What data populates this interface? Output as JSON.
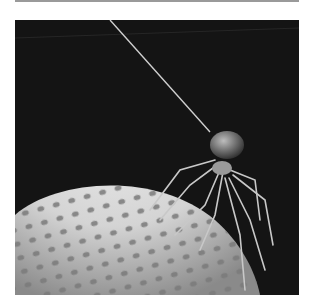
{
  "image": {
    "subject": "spider on textured dome",
    "alt": "Black-and-white photograph of a long-legged spider hanging from a silk thread, standing on a pitted, dome-shaped surface against a dark background",
    "colors": {
      "background": "#141414",
      "dome": "#d8d8d8",
      "pits": "#7a7a7a",
      "spider": "#c8c8c8",
      "frame_rule": "#9a9a9a"
    }
  }
}
